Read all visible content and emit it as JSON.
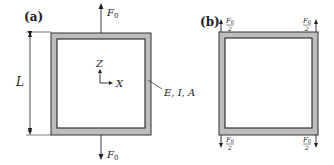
{
  "panel_a": {
    "label": "(a)",
    "dimension_label": "L",
    "force_top": "F",
    "force_top_sub": "0",
    "force_bottom": "F",
    "force_bottom_sub": "0",
    "axis_z": "Z",
    "axis_x": "X",
    "property_label": "E, I, A"
  },
  "panel_b": {
    "label": "(b)",
    "force_num": "F",
    "force_sub": "0",
    "force_den": "2"
  },
  "colors": {
    "frame_fill": "#bdbdbd",
    "frame_stroke": "#333333",
    "line": "#222222"
  }
}
